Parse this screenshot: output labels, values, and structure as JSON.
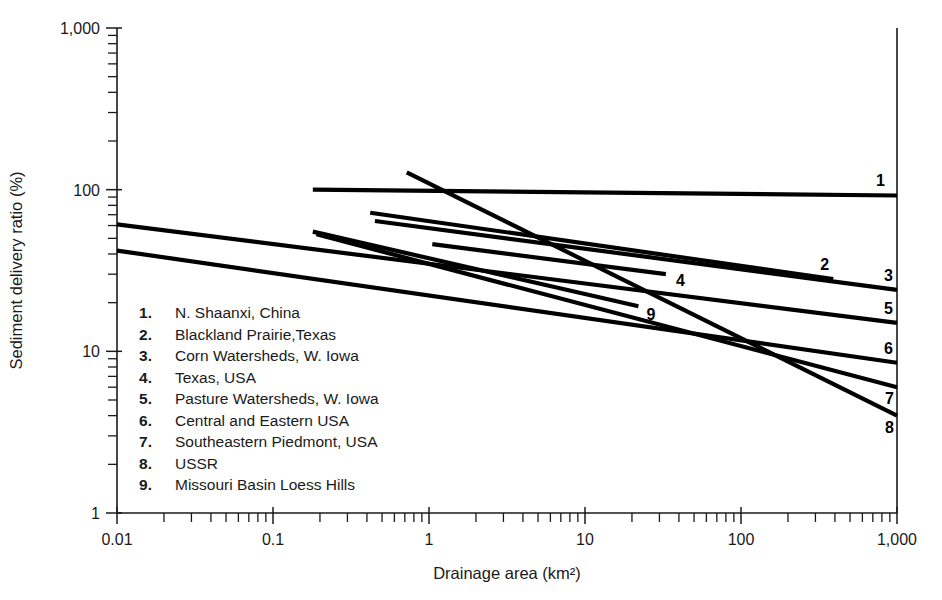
{
  "chart_data": {
    "type": "line",
    "title": "",
    "xlabel": "Drainage area (km²)",
    "ylabel": "Sediment delivery ratio (%)",
    "xscale": "log",
    "yscale": "log",
    "xlim": [
      0.01,
      1000
    ],
    "ylim": [
      1,
      1000
    ],
    "xticks": [
      0.01,
      0.1,
      1,
      10,
      100,
      1000
    ],
    "xticklabels": [
      "0.01",
      "0.1",
      "1",
      "10",
      "100",
      "1,000"
    ],
    "yticks": [
      1,
      10,
      100,
      1000
    ],
    "yticklabels": [
      "1",
      "10",
      "100",
      "1,000"
    ],
    "grid": false,
    "legend_position": "inside-lower-left",
    "series": [
      {
        "id": "1",
        "name": "N. Shaanxi, China",
        "label": "1",
        "x": [
          0.18,
          1000
        ],
        "y": [
          100,
          92
        ]
      },
      {
        "id": "2",
        "name": "Blackland Prairie,Texas",
        "label": "2",
        "x": [
          0.42,
          390
        ],
        "y": [
          72,
          28
        ]
      },
      {
        "id": "3",
        "name": "Corn Watersheds, W. Iowa",
        "label": "3",
        "x": [
          0.45,
          1000
        ],
        "y": [
          64,
          24
        ]
      },
      {
        "id": "4",
        "name": "Texas, USA",
        "label": "4",
        "x": [
          1.05,
          33
        ],
        "y": [
          46,
          30
        ]
      },
      {
        "id": "5",
        "name": "Pasture Watersheds, W. Iowa",
        "label": "5",
        "x": [
          0.01,
          1000
        ],
        "y": [
          61,
          15
        ]
      },
      {
        "id": "6",
        "name": "Central and Eastern USA",
        "label": "6",
        "x": [
          0.01,
          1000
        ],
        "y": [
          42,
          8.5
        ]
      },
      {
        "id": "7",
        "name": "Southeastern Piedmont, USA",
        "label": "7",
        "x": [
          0.19,
          1000
        ],
        "y": [
          53,
          6.0
        ]
      },
      {
        "id": "8",
        "name": "USSR",
        "label": "8",
        "x": [
          0.72,
          1000
        ],
        "y": [
          128,
          4.0
        ]
      },
      {
        "id": "9",
        "name": "Missouri Basin Loess Hills",
        "label": "9",
        "x": [
          0.18,
          22
        ],
        "y": [
          55,
          19
        ]
      }
    ]
  },
  "legend": {
    "entries": [
      {
        "num": "1.",
        "text": "N. Shaanxi, China"
      },
      {
        "num": "2.",
        "text": "Blackland Prairie,Texas"
      },
      {
        "num": "3.",
        "text": "Corn Watersheds, W. Iowa"
      },
      {
        "num": "4.",
        "text": "Texas, USA"
      },
      {
        "num": "5.",
        "text": "Pasture Watersheds, W. Iowa"
      },
      {
        "num": "6.",
        "text": "Central and Eastern USA"
      },
      {
        "num": "7.",
        "text": "Southeastern Piedmont, USA"
      },
      {
        "num": "8.",
        "text": "USSR"
      },
      {
        "num": "9.",
        "text": "Missouri Basin Loess Hills"
      }
    ]
  },
  "colors": {
    "ink": "#1a1a1a",
    "line": "#000000",
    "background": "#ffffff"
  }
}
